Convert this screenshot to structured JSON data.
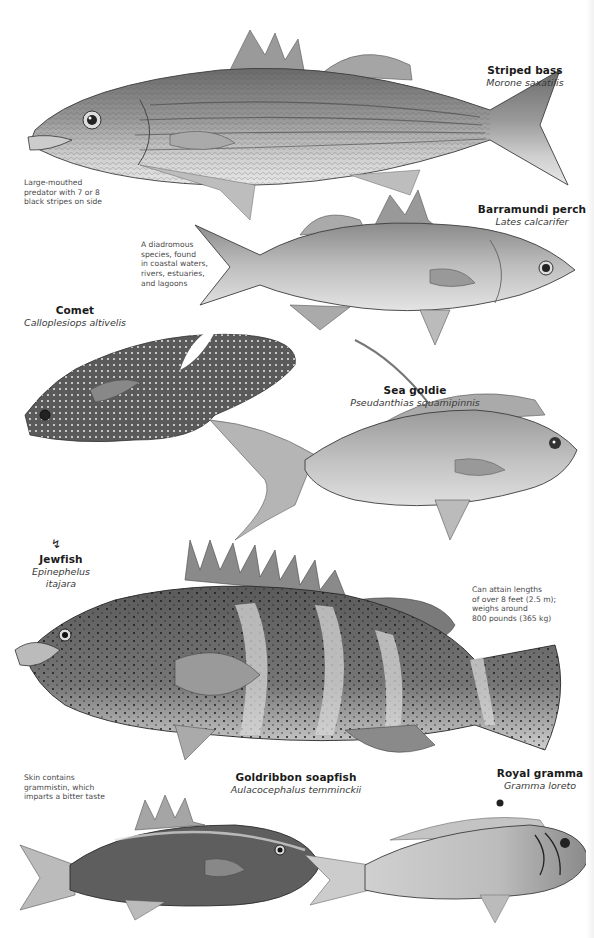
{
  "species": [
    {
      "id": "striped-bass",
      "common_name": "Striped bass",
      "scientific_name": "Morone saxatilis",
      "note_lines": [
        "Large-mouthed",
        "predator with 7 or 8",
        "black stripes on side"
      ]
    },
    {
      "id": "barramundi-perch",
      "common_name": "Barramundi perch",
      "scientific_name": "Lates calcarifer",
      "note_lines": [
        "A diadromous",
        "species, found",
        "in coastal waters,",
        "rivers, estuaries,",
        "and lagoons"
      ]
    },
    {
      "id": "comet",
      "common_name": "Comet",
      "scientific_name": "Calloplesiops altivelis"
    },
    {
      "id": "sea-goldie",
      "common_name": "Sea goldie",
      "scientific_name": "Pseudanthias squamipinnis"
    },
    {
      "id": "jewfish",
      "common_name": "Jewfish",
      "scientific_name": "Epinephelus itajara",
      "warning_icon": "danger-symbol-icon",
      "note_lines": [
        "Can attain lengths",
        "of over 8 feet (2.5 m);",
        "weighs around",
        "800 pounds (365 kg)"
      ]
    },
    {
      "id": "goldribbon-soapfish",
      "common_name": "Goldribbon soapfish",
      "scientific_name": "Aulacocephalus temminckii",
      "note_lines": [
        "Skin contains",
        "grammistin, which",
        "imparts a bitter taste"
      ]
    },
    {
      "id": "royal-gramma",
      "common_name": "Royal gramma",
      "scientific_name": "Gramma loreto"
    }
  ],
  "colors": {
    "background": "#ffffff",
    "ink_dark": "#3c3c3c",
    "ink_mid": "#8a8a8a",
    "ink_light": "#c8c8c8"
  }
}
